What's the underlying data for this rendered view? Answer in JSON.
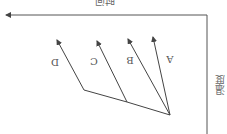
{
  "diagram": {
    "orientation": "rotated-180",
    "x_axis_label": "时间",
    "y_axis_label": "温度",
    "arrows": [
      {
        "label": "A"
      },
      {
        "label": "B"
      },
      {
        "label": "C"
      },
      {
        "label": "D"
      }
    ],
    "colors": {
      "line": "#444444",
      "axis": "#555555",
      "background": "#ffffff"
    }
  }
}
